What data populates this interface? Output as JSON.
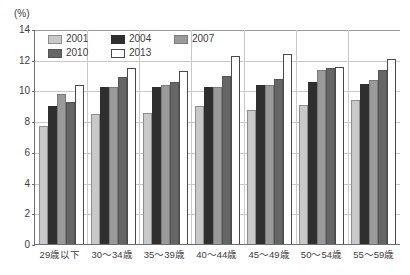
{
  "chart_data": {
    "type": "bar",
    "title": "",
    "subtitle": "",
    "xlabel": "",
    "ylabel": "(%)",
    "unit_label": "(%)",
    "ylim": [
      0,
      14
    ],
    "ytick_step": 2,
    "yticks": [
      "14",
      "12",
      "10",
      "8",
      "6",
      "4",
      "2",
      "0"
    ],
    "ytick_values": [
      14,
      12,
      10,
      8,
      6,
      4,
      2,
      0
    ],
    "grid": true,
    "grid_axis": "y",
    "legend_position": "top-left-inside",
    "categories": [
      "29歳以下",
      "30～34歳",
      "35～39歳",
      "40～44歳",
      "45～49歳",
      "50～54歳",
      "55～59歳"
    ],
    "series": [
      {
        "name": "2001",
        "color": "#c9c9c9",
        "values": [
          7.7,
          8.5,
          8.6,
          9.0,
          8.8,
          9.1,
          9.4
        ]
      },
      {
        "name": "2004",
        "color": "#2f2f2f",
        "values": [
          9.0,
          10.3,
          10.3,
          10.3,
          10.4,
          10.6,
          10.5
        ]
      },
      {
        "name": "2007",
        "color": "#9a9a9a",
        "values": [
          9.8,
          10.3,
          10.4,
          10.3,
          10.4,
          11.4,
          10.7
        ]
      },
      {
        "name": "2010",
        "color": "#666666",
        "values": [
          9.3,
          10.9,
          10.6,
          11.0,
          10.8,
          11.5,
          11.4
        ]
      },
      {
        "name": "2013",
        "color": "#ffffff",
        "values": [
          10.4,
          11.5,
          11.3,
          12.3,
          12.4,
          11.6,
          12.1
        ]
      }
    ]
  },
  "legend": {
    "items": [
      {
        "label": "2001",
        "swatch": "s2001"
      },
      {
        "label": "2004",
        "swatch": "s2004"
      },
      {
        "label": "2007",
        "swatch": "s2007"
      },
      {
        "label": "2010",
        "swatch": "s2010"
      },
      {
        "label": "2013",
        "swatch": "s2013"
      }
    ]
  }
}
